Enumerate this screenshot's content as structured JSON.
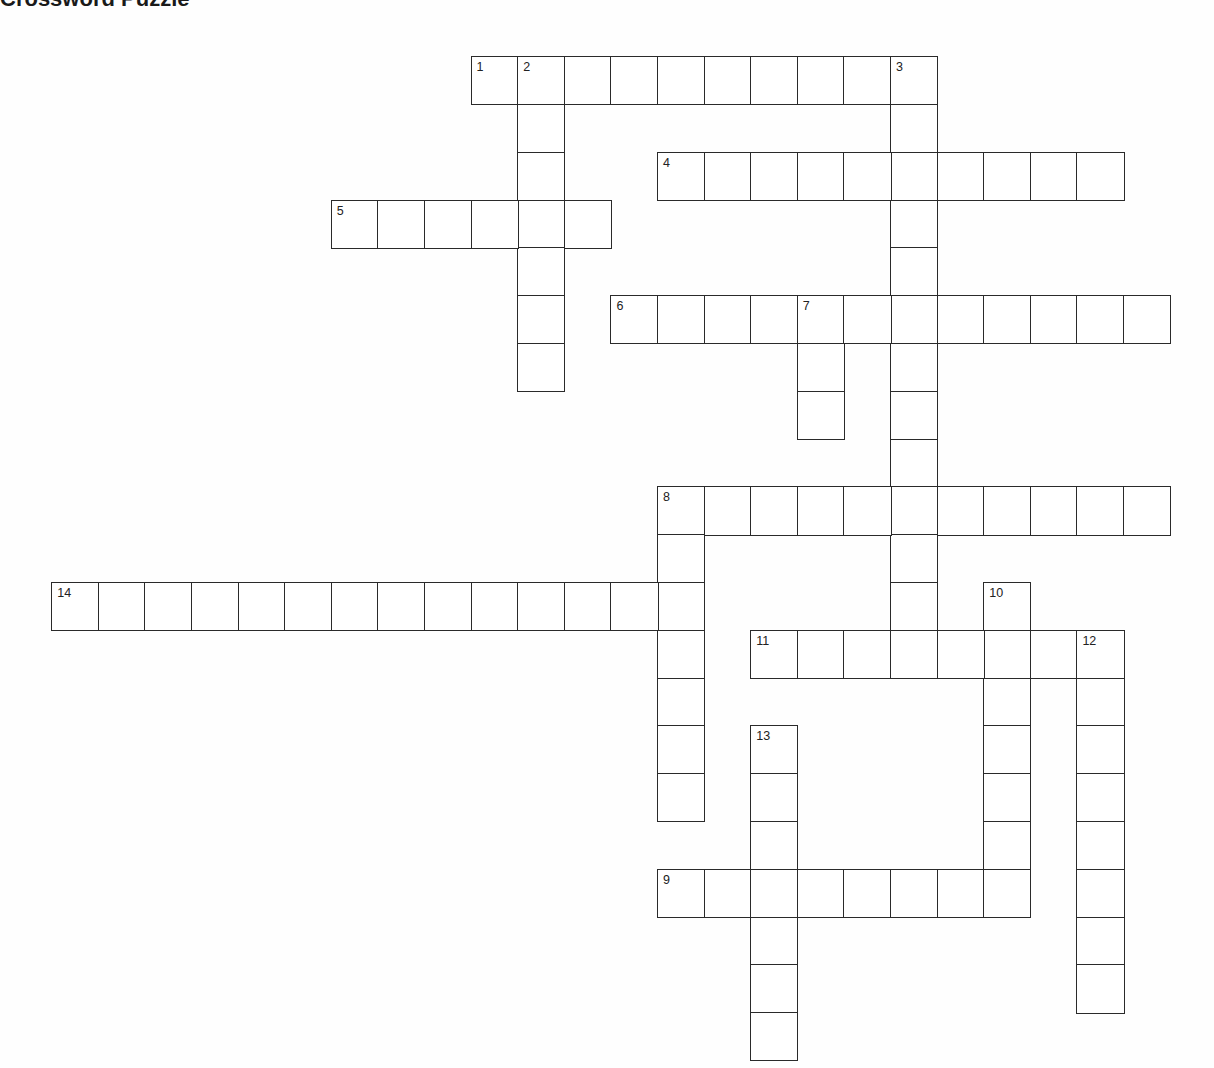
{
  "title": "Crossword Puzzle",
  "grid": {
    "origin_x": 52,
    "origin_y": 57,
    "cell_w": 46.6,
    "cell_h": 47.8,
    "line_color": "#2a2a2a"
  },
  "entries": [
    {
      "number": 1,
      "direction": "across",
      "row": 0,
      "col": 9,
      "length": 10
    },
    {
      "number": 2,
      "direction": "down",
      "row": 0,
      "col": 10,
      "length": 7
    },
    {
      "number": 3,
      "direction": "down",
      "row": 0,
      "col": 18,
      "length": 12
    },
    {
      "number": 4,
      "direction": "across",
      "row": 2,
      "col": 13,
      "length": 10
    },
    {
      "number": 5,
      "direction": "across",
      "row": 3,
      "col": 6,
      "length": 6
    },
    {
      "number": 6,
      "direction": "across",
      "row": 5,
      "col": 12,
      "length": 12
    },
    {
      "number": 7,
      "direction": "down",
      "row": 5,
      "col": 16,
      "length": 3
    },
    {
      "number": 8,
      "direction": "across",
      "row": 9,
      "col": 13,
      "length": 11
    },
    {
      "number": 8,
      "direction": "down",
      "row": 9,
      "col": 13,
      "length": 7
    },
    {
      "number": 9,
      "direction": "across",
      "row": 17,
      "col": 13,
      "length": 8
    },
    {
      "number": 10,
      "direction": "down",
      "row": 11,
      "col": 20,
      "length": 7
    },
    {
      "number": 11,
      "direction": "across",
      "row": 12,
      "col": 15,
      "length": 8
    },
    {
      "number": 12,
      "direction": "down",
      "row": 12,
      "col": 22,
      "length": 8
    },
    {
      "number": 13,
      "direction": "down",
      "row": 14,
      "col": 15,
      "length": 7
    },
    {
      "number": 14,
      "direction": "across",
      "row": 11,
      "col": 0,
      "length": 14
    }
  ]
}
